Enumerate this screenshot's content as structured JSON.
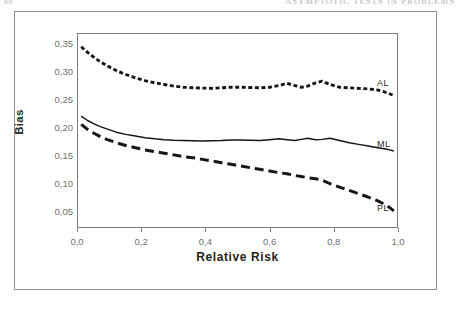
{
  "page": {
    "folio": "66",
    "running_head": "ASYMPTOTIC TESTS IN PROBLEMS"
  },
  "chart_data": {
    "type": "line",
    "title": "",
    "xlabel": "Relative Risk",
    "ylabel": "Bias",
    "xlim": [
      0.0,
      1.0
    ],
    "ylim": [
      0.02,
      0.368
    ],
    "grid": false,
    "legend_position": "inline-right",
    "xticks": [
      0.0,
      0.2,
      0.4,
      0.6,
      0.8,
      1.0
    ],
    "xticklabels": [
      "0,0",
      "0,2",
      "0,4",
      "0,6",
      "0,8",
      "1,0"
    ],
    "yticks": [
      0.05,
      0.1,
      0.15,
      0.2,
      0.25,
      0.3,
      0.35
    ],
    "yticklabels": [
      "0,05",
      "0,10",
      "0,15",
      "0,20",
      "0,25",
      "0,30",
      "0,35"
    ],
    "decimal_separator": ",",
    "series": [
      {
        "name": "AL",
        "label": "AL",
        "style": "dotted",
        "color": "#151515",
        "x": [
          0.01,
          0.03,
          0.05,
          0.07,
          0.09,
          0.12,
          0.15,
          0.18,
          0.21,
          0.24,
          0.27,
          0.3,
          0.33,
          0.36,
          0.39,
          0.42,
          0.45,
          0.48,
          0.51,
          0.54,
          0.57,
          0.6,
          0.63,
          0.655,
          0.68,
          0.7,
          0.72,
          0.745,
          0.765,
          0.79,
          0.82,
          0.85,
          0.88,
          0.91,
          0.94,
          0.97,
          0.99
        ],
        "values": [
          0.345,
          0.335,
          0.326,
          0.318,
          0.311,
          0.302,
          0.295,
          0.289,
          0.284,
          0.28,
          0.277,
          0.274,
          0.272,
          0.271,
          0.2705,
          0.27,
          0.271,
          0.272,
          0.272,
          0.2715,
          0.271,
          0.272,
          0.275,
          0.279,
          0.275,
          0.272,
          0.274,
          0.28,
          0.283,
          0.277,
          0.272,
          0.271,
          0.27,
          0.269,
          0.267,
          0.262,
          0.257
        ]
      },
      {
        "name": "ML",
        "label": "ML",
        "style": "solid",
        "color": "#151515",
        "x": [
          0.01,
          0.03,
          0.05,
          0.07,
          0.09,
          0.12,
          0.15,
          0.18,
          0.21,
          0.24,
          0.27,
          0.3,
          0.33,
          0.36,
          0.39,
          0.42,
          0.45,
          0.48,
          0.51,
          0.54,
          0.57,
          0.6,
          0.63,
          0.655,
          0.68,
          0.7,
          0.72,
          0.745,
          0.765,
          0.79,
          0.82,
          0.85,
          0.88,
          0.91,
          0.94,
          0.97,
          0.99
        ],
        "values": [
          0.22,
          0.212,
          0.206,
          0.201,
          0.197,
          0.191,
          0.187,
          0.184,
          0.181,
          0.179,
          0.1775,
          0.1765,
          0.176,
          0.1755,
          0.175,
          0.1755,
          0.176,
          0.177,
          0.177,
          0.1765,
          0.176,
          0.1775,
          0.179,
          0.1775,
          0.176,
          0.178,
          0.18,
          0.1775,
          0.178,
          0.18,
          0.176,
          0.172,
          0.169,
          0.166,
          0.163,
          0.16,
          0.157
        ]
      },
      {
        "name": "PL",
        "label": "PL",
        "style": "dashed",
        "color": "#151515",
        "x": [
          0.01,
          0.03,
          0.05,
          0.07,
          0.09,
          0.12,
          0.15,
          0.18,
          0.21,
          0.24,
          0.27,
          0.3,
          0.33,
          0.36,
          0.39,
          0.42,
          0.45,
          0.48,
          0.51,
          0.54,
          0.57,
          0.6,
          0.63,
          0.655,
          0.68,
          0.7,
          0.72,
          0.745,
          0.765,
          0.79,
          0.82,
          0.85,
          0.88,
          0.91,
          0.94,
          0.97,
          0.99
        ],
        "values": [
          0.205,
          0.196,
          0.189,
          0.183,
          0.178,
          0.172,
          0.167,
          0.163,
          0.159,
          0.156,
          0.153,
          0.15,
          0.147,
          0.145,
          0.142,
          0.139,
          0.136,
          0.133,
          0.13,
          0.127,
          0.124,
          0.121,
          0.118,
          0.116,
          0.113,
          0.111,
          0.109,
          0.107,
          0.1045,
          0.098,
          0.092,
          0.086,
          0.08,
          0.074,
          0.067,
          0.058,
          0.049
        ]
      }
    ]
  }
}
